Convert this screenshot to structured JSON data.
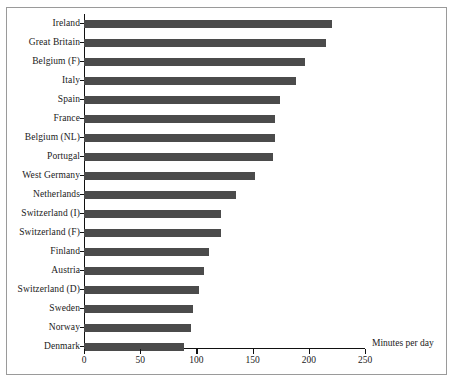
{
  "chart_data": {
    "type": "bar",
    "orientation": "horizontal",
    "title": "",
    "xlabel": "Minutes per day",
    "ylabel": "",
    "xlim": [
      0,
      250
    ],
    "xticks": [
      0,
      50,
      100,
      150,
      200,
      250
    ],
    "grid": false,
    "legend": null,
    "bar_color": "#4b4b4b",
    "categories": [
      "Ireland",
      "Great Britain",
      "Belgium (F)",
      "Italy",
      "Spain",
      "France",
      "Belgium (NL)",
      "Portugal",
      "West Germany",
      "Netherlands",
      "Switzerland (I)",
      "Switzerland (F)",
      "Finland",
      "Austria",
      "Switzerland (D)",
      "Sweden",
      "Norway",
      "Denmark"
    ],
    "values": [
      221,
      215,
      197,
      189,
      174,
      170,
      170,
      168,
      152,
      135,
      122,
      122,
      111,
      107,
      102,
      97,
      95,
      89
    ]
  }
}
